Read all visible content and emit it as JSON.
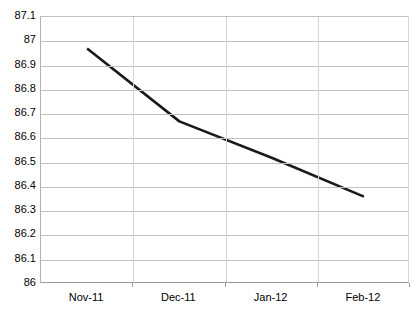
{
  "chart_data": {
    "type": "line",
    "title": "",
    "subtitle": "",
    "xlabel": "",
    "ylabel": "",
    "categories": [
      "Nov-11",
      "Dec-11",
      "Jan-12",
      "Feb-12"
    ],
    "series": [
      {
        "name": "",
        "values": [
          86.97,
          86.67,
          86.52,
          86.36
        ],
        "color": "#1a1a1a"
      }
    ],
    "ylim": [
      86,
      87.1
    ],
    "ytick_step": 0.1,
    "ytick_labels": [
      "87.1",
      "87",
      "86.9",
      "86.8",
      "86.7",
      "86.6",
      "86.5",
      "86.4",
      "86.3",
      "86.2",
      "86.1",
      "86"
    ],
    "ytick_values": [
      87.1,
      87,
      86.9,
      86.8,
      86.7,
      86.6,
      86.5,
      86.4,
      86.3,
      86.2,
      86.1,
      86
    ],
    "grid": {
      "horizontal": true,
      "vertical": true,
      "color": "#c0c0c0"
    },
    "legend": {
      "visible": false,
      "position": "none",
      "entries": []
    },
    "plot_background": "#ffffff",
    "border_color": "#b3b3b3"
  }
}
